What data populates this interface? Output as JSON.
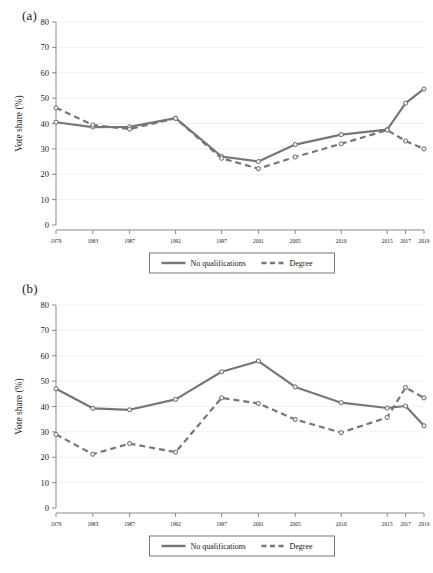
{
  "figure": {
    "panel_a_label": "(a)",
    "panel_b_label": "(b)"
  },
  "legend": {
    "solid_label": "No qualifications",
    "dashed_label": "Degree"
  },
  "chart_data": [
    {
      "type": "line",
      "panel": "(a)",
      "title": "",
      "xlabel": "",
      "ylabel": "Vote share (%)",
      "ylim": [
        0,
        80
      ],
      "yticks": [
        0,
        10,
        20,
        30,
        40,
        50,
        60,
        70,
        80
      ],
      "grid": true,
      "legend_position": "below",
      "categories": [
        "1979",
        "1983",
        "1987",
        "1992",
        "1997",
        "2001",
        "2005",
        "2010",
        "2015",
        "2017",
        "2019"
      ],
      "x": [
        1979,
        1983,
        1987,
        1992,
        1997,
        2001,
        2005,
        2010,
        2015,
        2017,
        2019
      ],
      "series": [
        {
          "name": "No qualifications",
          "style": "solid",
          "values": [
            40.5,
            38.6,
            38.7,
            42.1,
            27.0,
            25.0,
            31.7,
            35.6,
            37.6,
            48.0,
            53.6
          ]
        },
        {
          "name": "Degree",
          "style": "dashed",
          "values": [
            46.2,
            39.4,
            37.8,
            42.0,
            26.3,
            22.2,
            26.8,
            32.0,
            37.4,
            33.1,
            30.0
          ]
        }
      ]
    },
    {
      "type": "line",
      "panel": "(b)",
      "title": "",
      "xlabel": "",
      "ylabel": "Vote share (%)",
      "ylim": [
        0,
        80
      ],
      "yticks": [
        0,
        10,
        20,
        30,
        40,
        50,
        60,
        70,
        80
      ],
      "grid": true,
      "legend_position": "below",
      "categories": [
        "1979",
        "1983",
        "1987",
        "1992",
        "1997",
        "2001",
        "2005",
        "2010",
        "2015",
        "2017",
        "2019"
      ],
      "x": [
        1979,
        1983,
        1987,
        1992,
        1997,
        2001,
        2005,
        2010,
        2015,
        2017,
        2019
      ],
      "series": [
        {
          "name": "No qualifications",
          "style": "solid",
          "values": [
            47.0,
            39.3,
            38.7,
            42.8,
            53.7,
            57.9,
            47.7,
            41.5,
            39.4,
            40.2,
            32.4
          ]
        },
        {
          "name": "Degree",
          "style": "dashed",
          "values": [
            29.0,
            21.2,
            25.4,
            22.0,
            43.4,
            41.2,
            34.9,
            29.7,
            35.7,
            47.5,
            43.4
          ]
        }
      ]
    }
  ]
}
